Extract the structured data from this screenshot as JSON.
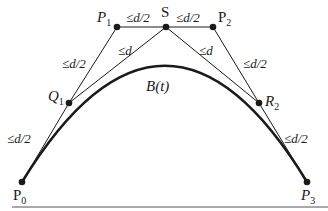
{
  "diagram": {
    "type": "bezier-subdivision",
    "colors": {
      "ink": "#1a1a1a",
      "rule": "#555555",
      "background": "#ffffff"
    },
    "curve": {
      "label": "B(t)",
      "label_pos": [
        146,
        91
      ]
    },
    "points": [
      {
        "id": "P0",
        "name": "P",
        "sub": "0",
        "x": 22,
        "y": 182,
        "lx": 13,
        "ly": 200,
        "italic": false
      },
      {
        "id": "P1",
        "name": "P",
        "sub": "1",
        "x": 117,
        "y": 27,
        "lx": 97,
        "ly": 22,
        "italic": true
      },
      {
        "id": "S",
        "name": "S",
        "sub": "",
        "x": 166,
        "y": 27,
        "lx": 161,
        "ly": 17,
        "italic": false
      },
      {
        "id": "P2",
        "name": "P",
        "sub": "2",
        "x": 213,
        "y": 27,
        "lx": 218,
        "ly": 22,
        "italic": false
      },
      {
        "id": "Q1",
        "name": "Q",
        "sub": "1",
        "x": 69,
        "y": 103,
        "lx": 48,
        "ly": 101,
        "italic": true
      },
      {
        "id": "R2",
        "name": "R",
        "sub": "2",
        "x": 259,
        "y": 103,
        "lx": 265,
        "ly": 106,
        "italic": true
      },
      {
        "id": "P3",
        "name": "P",
        "sub": "3",
        "x": 307,
        "y": 182,
        "lx": 301,
        "ly": 200,
        "italic": true
      }
    ],
    "segments": [
      {
        "from": "P0",
        "to": "Q1"
      },
      {
        "from": "Q1",
        "to": "P1"
      },
      {
        "from": "P1",
        "to": "S"
      },
      {
        "from": "S",
        "to": "P2"
      },
      {
        "from": "Q1",
        "to": "S"
      },
      {
        "from": "S",
        "to": "R2"
      },
      {
        "from": "P2",
        "to": "R2"
      },
      {
        "from": "R2",
        "to": "P3"
      }
    ],
    "annotations": [
      {
        "id": "ann-p1-s",
        "text": "≤d/2",
        "x": 126,
        "y": 22
      },
      {
        "id": "ann-s-p2",
        "text": "≤d/2",
        "x": 176,
        "y": 22
      },
      {
        "id": "ann-q1-p1",
        "text": "≤d/2",
        "x": 62,
        "y": 68
      },
      {
        "id": "ann-q1-s",
        "text": "≤d",
        "x": 118,
        "y": 55
      },
      {
        "id": "ann-s-r2",
        "text": "≤d",
        "x": 199,
        "y": 55
      },
      {
        "id": "ann-p2-r2",
        "text": "≤d/2",
        "x": 243,
        "y": 68
      },
      {
        "id": "ann-p0-q1",
        "text": "≤d/2",
        "x": 7,
        "y": 143
      },
      {
        "id": "ann-r2-p3",
        "text": "≤d/2",
        "x": 284,
        "y": 143
      }
    ],
    "rule": {
      "x1": 12,
      "x2": 328,
      "y": 207
    }
  }
}
